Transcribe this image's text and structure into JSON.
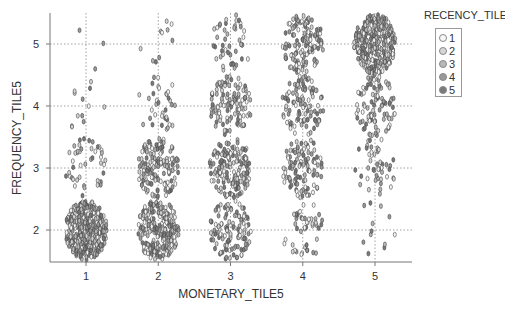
{
  "chart_data": {
    "type": "scatter",
    "title": "",
    "xlabel": "MONETARY_TILE5",
    "ylabel": "FREQUENCY_TILE5",
    "x_ticks": [
      "1",
      "2",
      "3",
      "4",
      "5"
    ],
    "y_ticks": [
      "2",
      "3",
      "4",
      "5"
    ],
    "xlim": [
      0.5,
      5.5
    ],
    "ylim": [
      1.5,
      5.5
    ],
    "grid": "dotted at integer ticks",
    "jitter": true,
    "legend": {
      "title": "RECENCY_TILE5",
      "position": "right-top",
      "entries": [
        {
          "label": "1",
          "color": "#f7f7f7"
        },
        {
          "label": "2",
          "color": "#d6d6d6"
        },
        {
          "label": "3",
          "color": "#b8b8b8"
        },
        {
          "label": "4",
          "color": "#999999"
        },
        {
          "label": "5",
          "color": "#7a7a7a"
        }
      ]
    },
    "cells": [
      {
        "monetary": 1,
        "frequency": 5,
        "approx_count": 3
      },
      {
        "monetary": 2,
        "frequency": 5,
        "approx_count": 10
      },
      {
        "monetary": 3,
        "frequency": 5,
        "approx_count": 45
      },
      {
        "monetary": 4,
        "frequency": 5,
        "approx_count": 130
      },
      {
        "monetary": 5,
        "frequency": 5,
        "approx_count": 300
      },
      {
        "monetary": 1,
        "frequency": 4,
        "approx_count": 12
      },
      {
        "monetary": 2,
        "frequency": 4,
        "approx_count": 35
      },
      {
        "monetary": 3,
        "frequency": 4,
        "approx_count": 110
      },
      {
        "monetary": 4,
        "frequency": 4,
        "approx_count": 100
      },
      {
        "monetary": 5,
        "frequency": 4,
        "approx_count": 90
      },
      {
        "monetary": 1,
        "frequency": 3,
        "approx_count": 45
      },
      {
        "monetary": 2,
        "frequency": 3,
        "approx_count": 140
      },
      {
        "monetary": 3,
        "frequency": 3,
        "approx_count": 150
      },
      {
        "monetary": 4,
        "frequency": 3,
        "approx_count": 100
      },
      {
        "monetary": 5,
        "frequency": 3,
        "approx_count": 45
      },
      {
        "monetary": 1,
        "frequency": 2,
        "approx_count": 350
      },
      {
        "monetary": 2,
        "frequency": 2,
        "approx_count": 220
      },
      {
        "monetary": 3,
        "frequency": 2,
        "approx_count": 120
      },
      {
        "monetary": 4,
        "frequency": 2,
        "approx_count": 45
      },
      {
        "monetary": 5,
        "frequency": 2,
        "approx_count": 12
      }
    ]
  },
  "legend": {
    "title": "RECENCY_TILE5",
    "items": [
      {
        "label": "1",
        "color": "#f7f7f7"
      },
      {
        "label": "2",
        "color": "#d6d6d6"
      },
      {
        "label": "3",
        "color": "#b8b8b8"
      },
      {
        "label": "4",
        "color": "#999999"
      },
      {
        "label": "5",
        "color": "#7a7a7a"
      }
    ]
  },
  "axes": {
    "xlabel": "MONETARY_TILE5",
    "ylabel": "FREQUENCY_TILE5"
  },
  "colors": {
    "axis": "#777777",
    "grid": "#8a8a8a",
    "marker_stroke": "#444444"
  }
}
